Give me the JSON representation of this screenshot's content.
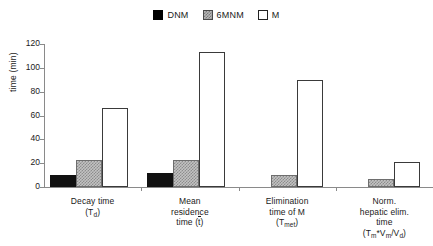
{
  "chart_data": {
    "type": "bar",
    "title": "",
    "xlabel": "",
    "ylabel": "time (min)",
    "ylim": [
      0,
      120
    ],
    "yticks": [
      0,
      20,
      40,
      60,
      80,
      100,
      120
    ],
    "grid": false,
    "legend_position": "top-center",
    "categories": [
      "Decay time (Td)",
      "Mean residence time (t̄)",
      "Elimination time of M (Tmet)",
      "Norm. hepatic elim. time (Tm*Vm/Vd)"
    ],
    "series": [
      {
        "name": "DNM",
        "values": [
          10,
          12,
          0,
          0
        ]
      },
      {
        "name": "6MNM",
        "values": [
          23,
          22.5,
          10,
          7
        ]
      },
      {
        "name": "M",
        "values": [
          66,
          113,
          90,
          21
        ]
      }
    ]
  },
  "legend": {
    "items": [
      {
        "label": "DNM",
        "swatch": "black-filled-square"
      },
      {
        "label": "6MNM",
        "swatch": "gray-hatched-square"
      },
      {
        "label": "M",
        "swatch": "white-outlined-square"
      }
    ]
  },
  "yaxis": {
    "label": "time (min)",
    "ticks": [
      "0",
      "20",
      "40",
      "60",
      "80",
      "100",
      "120"
    ]
  },
  "categories": [
    {
      "id": "decay-time",
      "lines": [
        "Decay time"
      ],
      "symbol_prefix": "(T",
      "symbol_sub": "d",
      "symbol_suffix": ")"
    },
    {
      "id": "mean-residence-time",
      "lines": [
        "Mean",
        "residence"
      ],
      "symbol_prefix": "time (",
      "symbol_overline": "t",
      "symbol_suffix": ")"
    },
    {
      "id": "elimination-time-of-m",
      "lines": [
        "Elimination",
        "time of M"
      ],
      "symbol_prefix": "(T",
      "symbol_sub": "met",
      "symbol_suffix": ")"
    },
    {
      "id": "norm-hepatic-elim-time",
      "lines": [
        "Norm.",
        "hepatic elim.",
        "time"
      ],
      "symbol_prefix": "(T",
      "symbol_sub": "m",
      "symbol_mid": "*V",
      "symbol_sub2": "m",
      "symbol_mid2": "/V",
      "symbol_sub3": "d",
      "symbol_suffix": ")"
    }
  ]
}
